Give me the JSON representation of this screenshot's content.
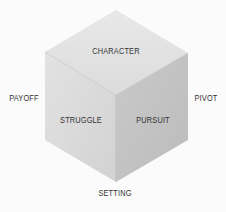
{
  "diagram": {
    "type": "isometric-cube",
    "faces": {
      "top": {
        "label": "CHARACTER",
        "color": "#e3e3e3"
      },
      "left": {
        "label": "STRUGGLE",
        "color": "#d9d9d9"
      },
      "right": {
        "label": "PURSUIT",
        "color": "#c2c2c2"
      }
    },
    "outer_labels": {
      "left": "PAYOFF",
      "right": "PIVOT",
      "bottom": "SETTING"
    },
    "colors": {
      "background": "#fbfbfb",
      "text": "#333333",
      "edge": "#b8b8b8"
    }
  }
}
